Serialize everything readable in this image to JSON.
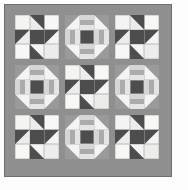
{
  "artwork": {
    "title": "Patchwork Quilt Sampler",
    "kind": "quilt-layout-diagram",
    "canvas": {
      "width": 188,
      "height": 190,
      "background": "#fdfdfd"
    },
    "quilt": {
      "x": 4,
      "y": 4,
      "width": 168,
      "height": 173,
      "border_width": 10,
      "border_color": "#8f8f8f",
      "edge_color": "#6f6f6f",
      "sashing_width": 6,
      "sashing_color": "#8f8f8f",
      "block_size": 44
    },
    "palette": {
      "background_light": "#f2f2f0",
      "background_white": "#fafafa",
      "dark": "#4d4d4d",
      "medium": "#9a9a9a",
      "light_gray": "#d6d6d6",
      "mid_light": "#c2c2c2",
      "seam": "#b9b9b9",
      "border": "#8f8f8f",
      "edge": "#6f6f6f"
    },
    "layout": {
      "rows": 3,
      "columns": 3,
      "blocks": [
        {
          "row": 0,
          "col": 0,
          "type": "friendship-star",
          "name": "block-star-top-left"
        },
        {
          "row": 0,
          "col": 1,
          "type": "churn-dash",
          "name": "block-churn-top-center"
        },
        {
          "row": 0,
          "col": 2,
          "type": "friendship-star",
          "name": "block-star-top-right"
        },
        {
          "row": 1,
          "col": 0,
          "type": "churn-dash",
          "name": "block-churn-middle-left"
        },
        {
          "row": 1,
          "col": 1,
          "type": "friendship-star",
          "name": "block-star-middle-center"
        },
        {
          "row": 1,
          "col": 2,
          "type": "churn-dash",
          "name": "block-churn-middle-right"
        },
        {
          "row": 2,
          "col": 0,
          "type": "friendship-star",
          "name": "block-star-bottom-left"
        },
        {
          "row": 2,
          "col": 1,
          "type": "churn-dash",
          "name": "block-churn-bottom-center"
        },
        {
          "row": 2,
          "col": 2,
          "type": "friendship-star",
          "name": "block-star-bottom-right"
        }
      ]
    },
    "block_specs": {
      "friendship-star": {
        "label": "Friendship Star Block",
        "grid": 3,
        "center_color": "#4d4d4d",
        "point_color": "#4d4d4d",
        "field_colors": [
          "#f4f4f2",
          "#ececea",
          "#f7f7f5"
        ],
        "description": "Dark square center with four angled star points on a light field"
      },
      "churn-dash": {
        "label": "Churn Dash Block",
        "grid": 3,
        "center_color": "#4d4d4d",
        "corner_triangle_color": "#9a9a9a",
        "rail_colors": [
          "#d6d6d6",
          "#ababab",
          "#e4e4e2"
        ],
        "field_colors": [
          "#f4f4f2",
          "#ececea"
        ],
        "description": "Medium-gray corner triangles, striped rails on each side, dark center square"
      }
    }
  }
}
